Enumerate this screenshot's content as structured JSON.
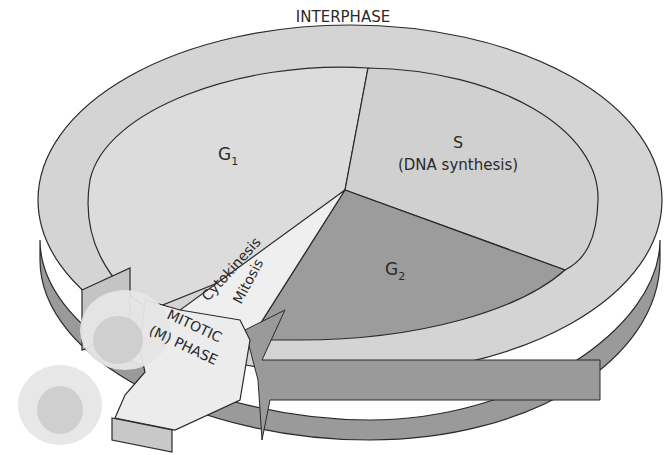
{
  "diagram": {
    "type": "cell-cycle",
    "colors": {
      "ring_top": "#d4d4d4",
      "ring_side": "#9a9a9a",
      "g1_fill": "#dcdcdc",
      "s_fill": "#d0d0d0",
      "g2_fill": "#9c9c9c",
      "mitosis_wedge": "#efefef",
      "arrow_fill": "#ececec",
      "arrow_side": "#c8c8c8",
      "outline": "#2a2a2a",
      "cell_body": "#e6e6e6",
      "cell_nucleus": "#cfcfcf"
    },
    "labels": {
      "interphase": "INTERPHASE",
      "g1": "G",
      "g1_sub": "1",
      "s": "S",
      "s_sub": "(DNA synthesis)",
      "g2": "G",
      "g2_sub": "2",
      "cytokinesis": "Cytokinesis",
      "mitosis": "Mitosis",
      "mitotic_line1": "MITOTIC",
      "mitotic_line2": "(M) PHASE"
    },
    "phases": [
      {
        "name": "G1",
        "label": "G1"
      },
      {
        "name": "S",
        "label": "S (DNA synthesis)"
      },
      {
        "name": "G2",
        "label": "G2"
      },
      {
        "name": "M",
        "label": "Mitosis / Cytokinesis"
      }
    ]
  }
}
